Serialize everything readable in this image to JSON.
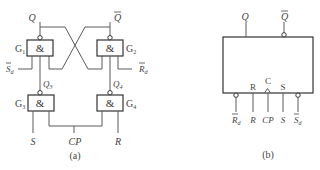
{
  "figure": {
    "diagram_a": {
      "caption": "(a)",
      "gates": [
        {
          "id": "G1",
          "label": "G",
          "sub": "1",
          "symbol": "&"
        },
        {
          "id": "G2",
          "label": "G",
          "sub": "2",
          "symbol": "&"
        },
        {
          "id": "G3",
          "label": "G",
          "sub": "3",
          "symbol": "&"
        },
        {
          "id": "G4",
          "label": "G",
          "sub": "4",
          "symbol": "&"
        }
      ],
      "signals": {
        "q": "Q",
        "q_bar": "Q",
        "sd_bar": "S",
        "sd_sub": "d",
        "rd_bar": "R",
        "rd_sub": "d",
        "q3": "Q",
        "q3_sub": "3",
        "q4": "Q",
        "q4_sub": "4",
        "s": "S",
        "cp": "CP",
        "r": "R"
      }
    },
    "diagram_b": {
      "caption": "(b)",
      "outputs": {
        "q": "Q",
        "q_bar": "Q"
      },
      "inner_labels": {
        "r": "R",
        "c": "C",
        "s": "S"
      },
      "pins": {
        "rd_bar": "R",
        "rd_sub": "d",
        "r": "R",
        "cp": "CP",
        "s": "S",
        "sd_bar": "S",
        "sd_sub": "d"
      }
    }
  }
}
